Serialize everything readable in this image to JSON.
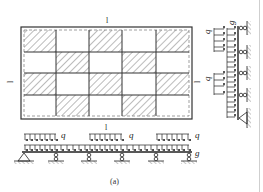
{
  "figure": {
    "caption": "(a)",
    "colors": {
      "line": "#333333",
      "hatch": "#555555",
      "edge": "#cfcfcf"
    }
  },
  "plan": {
    "grid_cols": 5,
    "grid_rows": 4,
    "span_label_top": "l",
    "span_label_left": "l",
    "span_label_right": "l",
    "hatched_cells": [
      [
        0,
        0
      ],
      [
        0,
        2
      ],
      [
        0,
        4
      ],
      [
        1,
        1
      ],
      [
        1,
        3
      ],
      [
        2,
        0
      ],
      [
        2,
        2
      ],
      [
        2,
        4
      ],
      [
        3,
        1
      ],
      [
        3,
        3
      ]
    ],
    "inner_border": "dashed"
  },
  "horizontal_beam": {
    "span_label": "l",
    "live_load_label": "q",
    "dead_load_label": "g",
    "supports": [
      "pin",
      "roller",
      "roller",
      "roller",
      "roller",
      "roller"
    ],
    "live_load_spans": [
      1,
      3,
      5
    ]
  },
  "vertical_beam": {
    "live_load_label_1": "q",
    "live_load_label_2": "q",
    "dead_load_label": "g",
    "supports": [
      "roller",
      "roller",
      "roller",
      "roller",
      "pin"
    ],
    "live_load_spans": [
      1,
      3
    ]
  }
}
